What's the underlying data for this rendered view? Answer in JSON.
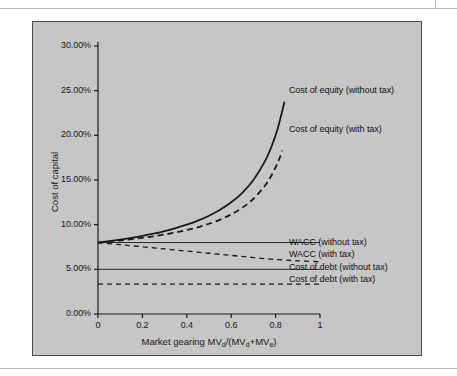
{
  "page": {
    "background": "#ffffff",
    "panel_color": "#c6c6c6",
    "rule_color": "#b9b9b9",
    "line_color": "#1a1a1a"
  },
  "chart_data": {
    "type": "line",
    "title": "",
    "xlabel": "Market gearing MVd/(MVd+MVe)",
    "xlabel_parts": {
      "prefix": "Market gearing MV",
      "sub1": "d",
      "mid": "/(MV",
      "sub2": "d",
      "plus": "+MV",
      "sub3": "e",
      "suffix": ")"
    },
    "ylabel": "Cost of capital",
    "xlim": [
      0,
      1
    ],
    "ylim": [
      0,
      30
    ],
    "grid": false,
    "legend_position": "right-inline-annotations",
    "xticks": [
      "0",
      "0.2",
      "0.4",
      "0.6",
      "0.8",
      "1"
    ],
    "xtick_values": [
      0,
      0.2,
      0.4,
      0.6,
      0.8,
      1
    ],
    "yticks": [
      "0.00%",
      "5.00%",
      "10.00%",
      "15.00%",
      "20.00%",
      "25.00%",
      "30.00%"
    ],
    "ytick_values": [
      0,
      5,
      10,
      15,
      20,
      25,
      30
    ],
    "series": [
      {
        "name": "Cost of equity (without tax)",
        "style": "solid",
        "x": [
          0.0,
          0.05,
          0.1,
          0.15,
          0.2,
          0.25,
          0.3,
          0.35,
          0.4,
          0.45,
          0.5,
          0.55,
          0.6,
          0.65,
          0.7,
          0.75,
          0.78,
          0.81,
          0.84
        ],
        "values": [
          8.0,
          8.16,
          8.33,
          8.53,
          8.75,
          9.0,
          9.29,
          9.62,
          10.0,
          10.45,
          11.0,
          11.67,
          12.5,
          13.57,
          15.0,
          17.0,
          18.64,
          20.79,
          23.75
        ]
      },
      {
        "name": "Cost of equity (with tax)",
        "style": "dashed",
        "x": [
          0.0,
          0.05,
          0.1,
          0.15,
          0.2,
          0.25,
          0.3,
          0.35,
          0.4,
          0.45,
          0.5,
          0.55,
          0.6,
          0.65,
          0.7,
          0.75,
          0.78,
          0.81,
          0.83
        ],
        "values": [
          8.0,
          8.11,
          8.23,
          8.38,
          8.53,
          8.7,
          8.9,
          9.13,
          9.4,
          9.71,
          10.1,
          10.57,
          11.15,
          11.9,
          12.9,
          14.3,
          15.45,
          16.95,
          18.3
        ]
      },
      {
        "name": "WACC (without tax)",
        "style": "solid",
        "x": [
          0.0,
          1.0
        ],
        "values": [
          8.0,
          8.0
        ]
      },
      {
        "name": "WACC (with tax)",
        "style": "dashed",
        "x": [
          0.0,
          0.1,
          0.2,
          0.3,
          0.4,
          0.5,
          0.6,
          0.7,
          0.8,
          0.9,
          1.0
        ],
        "values": [
          8.0,
          7.76,
          7.52,
          7.28,
          7.04,
          6.8,
          6.56,
          6.32,
          6.1,
          5.95,
          5.85
        ]
      },
      {
        "name": "Cost of debt (without tax)",
        "style": "solid",
        "x": [
          0.0,
          1.0
        ],
        "values": [
          5.0,
          5.0
        ]
      },
      {
        "name": "Cost of debt (with tax)",
        "style": "dashed",
        "x": [
          0.0,
          1.0
        ],
        "values": [
          3.35,
          3.35
        ]
      }
    ],
    "annotations": [
      {
        "text": "Cost of equity (without tax)",
        "x": 0.86,
        "y": 25.0
      },
      {
        "text": "Cost of equity (with tax)",
        "x": 0.86,
        "y": 20.6
      },
      {
        "text": "WACC (without tax)",
        "x": 0.86,
        "y": 8.0
      },
      {
        "text": "WACC (with tax)",
        "x": 0.86,
        "y": 6.6
      },
      {
        "text": "Cost of debt (without tax)",
        "x": 0.86,
        "y": 5.2
      },
      {
        "text": "Cost of debt (with tax)",
        "x": 0.86,
        "y": 3.8
      }
    ]
  }
}
